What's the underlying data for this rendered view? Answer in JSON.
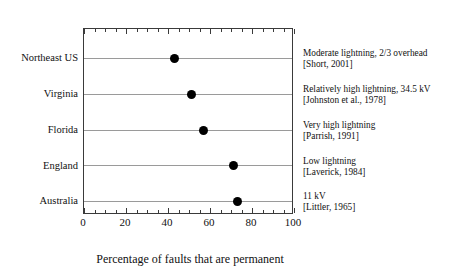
{
  "chart_data": {
    "type": "scatter",
    "subtype": "dot-plot",
    "title": "",
    "xlabel": "Percentage of faults that are permanent",
    "ylabel": "",
    "categories": [
      "Northeast US",
      "Virginia",
      "Florida",
      "England",
      "Australia"
    ],
    "values": [
      43,
      51,
      57,
      71,
      73
    ],
    "series": [
      {
        "name": "Percentage of faults that are permanent",
        "values": [
          43,
          51,
          57,
          71,
          73
        ]
      }
    ],
    "xlim": [
      0,
      100
    ],
    "xticks": [
      0,
      20,
      40,
      60,
      80,
      100
    ],
    "xtick_labels": [
      "0",
      "20",
      "40",
      "60",
      "80",
      "100"
    ],
    "minor_tick_interval": 5,
    "grid": "horizontal-per-category",
    "legend": "none",
    "marker": "filled-circle",
    "marker_color": "#000000",
    "frame": "box",
    "annotations": [
      {
        "category": "Northeast US",
        "value": 43,
        "line1": "Moderate lightning, 2/3 overhead",
        "line2": "[Short, 2001]"
      },
      {
        "category": "Virginia",
        "value": 51,
        "line1": "Relatively high lightning, 34.5 kV",
        "line2": "[Johnston et al., 1978]"
      },
      {
        "category": "Florida",
        "value": 57,
        "line1": "Very high lightning",
        "line2": "[Parrish, 1991]"
      },
      {
        "category": "England",
        "value": 71,
        "line1": "Low lightning",
        "line2": "[Laverick, 1984]"
      },
      {
        "category": "Australia",
        "value": 73,
        "line1": "11 kV",
        "line2": "[Littler, 1965]"
      }
    ]
  }
}
